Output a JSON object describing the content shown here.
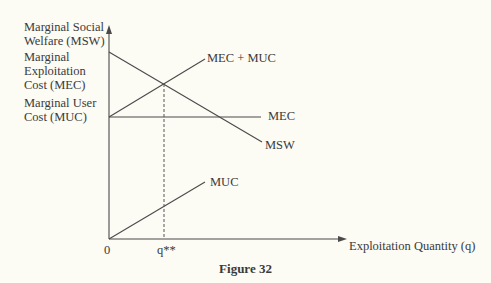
{
  "figure": {
    "caption": "Figure 32",
    "y_axis_labels": {
      "msw_line1": "Marginal Social",
      "msw_line2": "Welfare (MSW)",
      "mec_line1": "Marginal",
      "mec_line2": "Exploitation",
      "mec_line3": "Cost (MEC)",
      "muc_line1": "Marginal User",
      "muc_line2": "Cost (MUC)"
    },
    "x_axis_label": "Exploitation Quantity (q)",
    "origin_label": "0",
    "optimum_label": "q**",
    "curves": {
      "mec_plus_muc": "MEC + MUC",
      "mec": "MEC",
      "msw": "MSW",
      "muc": "MUC"
    },
    "colors": {
      "ink": "#4a4a4a",
      "background": "#fcfbf4"
    }
  }
}
